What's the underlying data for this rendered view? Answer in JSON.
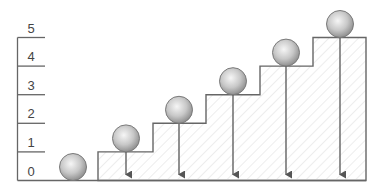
{
  "diagram": {
    "y_axis": {
      "labels": [
        "0",
        "1",
        "2",
        "3",
        "4",
        "5"
      ],
      "levels": [
        0,
        1,
        2,
        3,
        4,
        5
      ]
    },
    "steps": [
      {
        "level": 1,
        "x1": 98,
        "x2": 153
      },
      {
        "level": 2,
        "x1": 153,
        "x2": 206
      },
      {
        "level": 3,
        "x1": 206,
        "x2": 260
      },
      {
        "level": 4,
        "x1": 260,
        "x2": 313
      },
      {
        "level": 5,
        "x1": 313,
        "x2": 366
      }
    ],
    "spheres": [
      {
        "level": 0,
        "cx": 73
      },
      {
        "level": 1,
        "cx": 126
      },
      {
        "level": 2,
        "cx": 179
      },
      {
        "level": 3,
        "cx": 233
      },
      {
        "level": 4,
        "cx": 286
      },
      {
        "level": 5,
        "cx": 340
      }
    ],
    "colors": {
      "line": "#666666",
      "hatch": "#d9d9d9",
      "sphere_light": "#f4f4f4",
      "sphere_dark": "#8a8a8a"
    }
  }
}
